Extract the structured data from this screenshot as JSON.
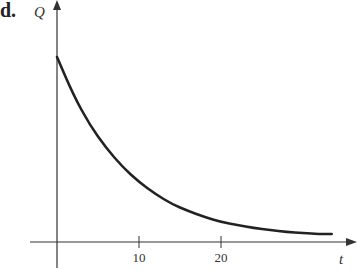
{
  "panel_label": "d.",
  "chart_data": {
    "type": "line",
    "title": "",
    "xlabel": "t",
    "ylabel": "Q",
    "x_ticks": [
      10,
      20
    ],
    "y_ticks": [],
    "xlim": [
      0,
      34
    ],
    "grid": false,
    "legend": null,
    "series": [
      {
        "name": "Q(t) exponential decay",
        "x": [
          0,
          2,
          4,
          6,
          8,
          10,
          12,
          14,
          16,
          18,
          20,
          22,
          24,
          26,
          28,
          30,
          32,
          33.5
        ],
        "values": [
          185,
          147,
          117,
          94,
          75,
          60,
          48,
          38,
          31,
          25,
          20,
          17,
          14,
          12,
          10,
          9,
          8,
          8
        ]
      }
    ]
  }
}
